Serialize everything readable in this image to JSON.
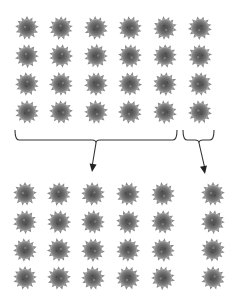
{
  "diagram": {
    "flower_color": "#6e6e6e",
    "flower_center_color": "#4a4a4a",
    "line_color": "#333333",
    "top_array": {
      "rows": 4,
      "cols": 6,
      "col_x": [
        27,
        61,
        96,
        130,
        165,
        200
      ],
      "row_y": [
        28,
        56,
        84,
        112
      ]
    },
    "brackets": [
      {
        "name": "left-group-bracket",
        "x1": 15,
        "x2": 177,
        "peak_x": 96,
        "y_top": 130,
        "y_bottom": 141,
        "arrow_to": [
          92,
          172
        ],
        "covers_cols": 5
      },
      {
        "name": "right-group-bracket",
        "x1": 183,
        "x2": 214,
        "peak_x": 199,
        "y_top": 130,
        "y_bottom": 141,
        "arrow_to": [
          205,
          174
        ],
        "covers_cols": 1
      }
    ],
    "bottom_left_array": {
      "rows": 4,
      "cols": 5,
      "col_x": [
        25,
        59,
        93,
        128,
        163
      ],
      "row_y": [
        194,
        222,
        250,
        278
      ]
    },
    "bottom_right_array": {
      "rows": 4,
      "cols": 1,
      "col_x": [
        213
      ],
      "row_y": [
        194,
        222,
        250,
        278
      ]
    }
  }
}
